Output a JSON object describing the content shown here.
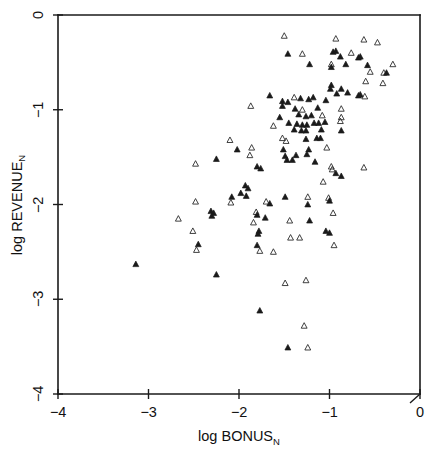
{
  "chart_data": {
    "type": "scatter",
    "title": "",
    "xlabel": "log BONUS",
    "xlabel_subscript": "N",
    "ylabel": "log REVENUE",
    "ylabel_subscript": "N",
    "xlim": [
      -4,
      0
    ],
    "ylim": [
      -4,
      0
    ],
    "xticks": [
      -4,
      -3,
      -2,
      -1,
      0
    ],
    "xtick_labels": [
      "−4",
      "−3",
      "−2",
      "−1",
      "0"
    ],
    "yticks": [
      0,
      -1,
      -2,
      -3,
      -4
    ],
    "ytick_labels": [
      "0",
      "−1",
      "−2",
      "−3",
      "−4"
    ],
    "grid": false,
    "legend": null,
    "marker": "triangle",
    "marker_colors": {
      "filled": "#1a1a1a",
      "open": "#2b2b2b"
    },
    "series": [
      {
        "name": "observations",
        "points": [
          {
            "x": -1.5,
            "y": -0.22,
            "fill": "open"
          },
          {
            "x": -0.93,
            "y": -0.25,
            "fill": "open"
          },
          {
            "x": -0.62,
            "y": -0.26,
            "fill": "open"
          },
          {
            "x": -0.47,
            "y": -0.29,
            "fill": "open"
          },
          {
            "x": -1.46,
            "y": -0.41,
            "fill": "filled"
          },
          {
            "x": -1.3,
            "y": -0.41,
            "fill": "open"
          },
          {
            "x": -0.96,
            "y": -0.39,
            "fill": "filled"
          },
          {
            "x": -0.93,
            "y": -0.38,
            "fill": "filled"
          },
          {
            "x": -0.76,
            "y": -0.4,
            "fill": "open"
          },
          {
            "x": -0.88,
            "y": -0.44,
            "fill": "filled"
          },
          {
            "x": -0.68,
            "y": -0.45,
            "fill": "filled"
          },
          {
            "x": -0.66,
            "y": -0.44,
            "fill": "filled"
          },
          {
            "x": -1.22,
            "y": -0.52,
            "fill": "filled"
          },
          {
            "x": -0.98,
            "y": -0.52,
            "fill": "open"
          },
          {
            "x": -0.98,
            "y": -0.55,
            "fill": "filled"
          },
          {
            "x": -0.82,
            "y": -0.52,
            "fill": "filled"
          },
          {
            "x": -0.58,
            "y": -0.53,
            "fill": "filled"
          },
          {
            "x": -0.3,
            "y": -0.52,
            "fill": "open"
          },
          {
            "x": -0.55,
            "y": -0.6,
            "fill": "open"
          },
          {
            "x": -0.4,
            "y": -0.61,
            "fill": "open"
          },
          {
            "x": -0.37,
            "y": -0.61,
            "fill": "filled"
          },
          {
            "x": -0.6,
            "y": -0.7,
            "fill": "open"
          },
          {
            "x": -0.41,
            "y": -0.72,
            "fill": "open"
          },
          {
            "x": -0.98,
            "y": -0.74,
            "fill": "filled"
          },
          {
            "x": -0.99,
            "y": -0.78,
            "fill": "filled"
          },
          {
            "x": -0.87,
            "y": -0.78,
            "fill": "filled"
          },
          {
            "x": -0.92,
            "y": -0.83,
            "fill": "filled"
          },
          {
            "x": -0.8,
            "y": -0.82,
            "fill": "filled"
          },
          {
            "x": -0.68,
            "y": -0.85,
            "fill": "filled"
          },
          {
            "x": -0.66,
            "y": -0.84,
            "fill": "filled"
          },
          {
            "x": -0.61,
            "y": -0.86,
            "fill": "open"
          },
          {
            "x": -1.66,
            "y": -0.85,
            "fill": "filled"
          },
          {
            "x": -1.52,
            "y": -0.91,
            "fill": "filled"
          },
          {
            "x": -1.46,
            "y": -0.92,
            "fill": "filled"
          },
          {
            "x": -1.39,
            "y": -0.87,
            "fill": "open"
          },
          {
            "x": -1.32,
            "y": -0.88,
            "fill": "filled"
          },
          {
            "x": -1.23,
            "y": -0.89,
            "fill": "filled"
          },
          {
            "x": -1.18,
            "y": -0.87,
            "fill": "filled"
          },
          {
            "x": -1.04,
            "y": -0.9,
            "fill": "filled"
          },
          {
            "x": -1.87,
            "y": -0.96,
            "fill": "open"
          },
          {
            "x": -1.52,
            "y": -0.96,
            "fill": "filled"
          },
          {
            "x": -1.38,
            "y": -0.99,
            "fill": "filled"
          },
          {
            "x": -1.3,
            "y": -1.0,
            "fill": "open"
          },
          {
            "x": -1.13,
            "y": -0.98,
            "fill": "filled"
          },
          {
            "x": -0.87,
            "y": -0.99,
            "fill": "open"
          },
          {
            "x": -1.55,
            "y": -1.08,
            "fill": "filled"
          },
          {
            "x": -1.34,
            "y": -1.05,
            "fill": "filled"
          },
          {
            "x": -1.26,
            "y": -1.07,
            "fill": "filled"
          },
          {
            "x": -1.2,
            "y": -1.06,
            "fill": "filled"
          },
          {
            "x": -1.08,
            "y": -1.06,
            "fill": "open"
          },
          {
            "x": -0.87,
            "y": -1.08,
            "fill": "open"
          },
          {
            "x": -1.62,
            "y": -1.17,
            "fill": "open"
          },
          {
            "x": -1.45,
            "y": -1.14,
            "fill": "filled"
          },
          {
            "x": -1.36,
            "y": -1.15,
            "fill": "filled"
          },
          {
            "x": -1.3,
            "y": -1.16,
            "fill": "filled"
          },
          {
            "x": -1.25,
            "y": -1.16,
            "fill": "filled"
          },
          {
            "x": -1.17,
            "y": -1.14,
            "fill": "filled"
          },
          {
            "x": -1.12,
            "y": -1.14,
            "fill": "filled"
          },
          {
            "x": -1.05,
            "y": -1.13,
            "fill": "filled"
          },
          {
            "x": -0.88,
            "y": -1.12,
            "fill": "open"
          },
          {
            "x": -1.39,
            "y": -1.21,
            "fill": "filled"
          },
          {
            "x": -1.31,
            "y": -1.22,
            "fill": "filled"
          },
          {
            "x": -1.26,
            "y": -1.22,
            "fill": "filled"
          },
          {
            "x": -1.09,
            "y": -1.21,
            "fill": "filled"
          },
          {
            "x": -0.87,
            "y": -1.22,
            "fill": "filled"
          },
          {
            "x": -1.52,
            "y": -1.3,
            "fill": "open"
          },
          {
            "x": -1.48,
            "y": -1.33,
            "fill": "open"
          },
          {
            "x": -1.26,
            "y": -1.31,
            "fill": "filled"
          },
          {
            "x": -1.14,
            "y": -1.3,
            "fill": "filled"
          },
          {
            "x": -1.1,
            "y": -1.3,
            "fill": "filled"
          },
          {
            "x": -2.1,
            "y": -1.32,
            "fill": "open"
          },
          {
            "x": -1.51,
            "y": -1.42,
            "fill": "filled"
          },
          {
            "x": -1.23,
            "y": -1.42,
            "fill": "filled"
          },
          {
            "x": -1.03,
            "y": -1.4,
            "fill": "open"
          },
          {
            "x": -2.02,
            "y": -1.42,
            "fill": "filled"
          },
          {
            "x": -1.86,
            "y": -1.4,
            "fill": "open"
          },
          {
            "x": -1.49,
            "y": -1.49,
            "fill": "filled"
          },
          {
            "x": -1.37,
            "y": -1.48,
            "fill": "filled"
          },
          {
            "x": -1.25,
            "y": -1.47,
            "fill": "filled"
          },
          {
            "x": -1.88,
            "y": -1.48,
            "fill": "open"
          },
          {
            "x": -1.47,
            "y": -1.53,
            "fill": "filled"
          },
          {
            "x": -1.41,
            "y": -1.53,
            "fill": "filled"
          },
          {
            "x": -1.16,
            "y": -1.55,
            "fill": "filled"
          },
          {
            "x": -2.25,
            "y": -1.52,
            "fill": "filled"
          },
          {
            "x": -2.48,
            "y": -1.57,
            "fill": "open"
          },
          {
            "x": -1.8,
            "y": -1.6,
            "fill": "filled"
          },
          {
            "x": -1.76,
            "y": -1.62,
            "fill": "filled"
          },
          {
            "x": -0.98,
            "y": -1.6,
            "fill": "open"
          },
          {
            "x": -0.97,
            "y": -1.63,
            "fill": "open"
          },
          {
            "x": -0.62,
            "y": -1.61,
            "fill": "open"
          },
          {
            "x": -0.93,
            "y": -1.67,
            "fill": "filled"
          },
          {
            "x": -0.87,
            "y": -1.7,
            "fill": "filled"
          },
          {
            "x": -1.07,
            "y": -1.76,
            "fill": "open"
          },
          {
            "x": -1.93,
            "y": -1.8,
            "fill": "filled"
          },
          {
            "x": -1.9,
            "y": -1.83,
            "fill": "filled"
          },
          {
            "x": -1.98,
            "y": -1.88,
            "fill": "filled"
          },
          {
            "x": -1.92,
            "y": -1.91,
            "fill": "filled"
          },
          {
            "x": -2.08,
            "y": -1.92,
            "fill": "filled"
          },
          {
            "x": -1.49,
            "y": -1.92,
            "fill": "filled"
          },
          {
            "x": -1.24,
            "y": -1.92,
            "fill": "open"
          },
          {
            "x": -1.01,
            "y": -1.93,
            "fill": "open"
          },
          {
            "x": -1.0,
            "y": -1.96,
            "fill": "filled"
          },
          {
            "x": -2.48,
            "y": -1.97,
            "fill": "open"
          },
          {
            "x": -2.09,
            "y": -1.98,
            "fill": "open"
          },
          {
            "x": -1.7,
            "y": -1.97,
            "fill": "open"
          },
          {
            "x": -1.66,
            "y": -1.99,
            "fill": "filled"
          },
          {
            "x": -1.24,
            "y": -2.0,
            "fill": "filled"
          },
          {
            "x": -0.96,
            "y": -2.09,
            "fill": "open"
          },
          {
            "x": -2.31,
            "y": -2.07,
            "fill": "filled"
          },
          {
            "x": -2.28,
            "y": -2.09,
            "fill": "filled"
          },
          {
            "x": -2.3,
            "y": -2.12,
            "fill": "filled"
          },
          {
            "x": -1.81,
            "y": -2.08,
            "fill": "open"
          },
          {
            "x": -1.8,
            "y": -2.11,
            "fill": "filled"
          },
          {
            "x": -1.71,
            "y": -2.14,
            "fill": "filled"
          },
          {
            "x": -2.67,
            "y": -2.15,
            "fill": "open"
          },
          {
            "x": -1.84,
            "y": -2.19,
            "fill": "open"
          },
          {
            "x": -1.44,
            "y": -2.17,
            "fill": "open"
          },
          {
            "x": -1.22,
            "y": -2.17,
            "fill": "filled"
          },
          {
            "x": -2.51,
            "y": -2.28,
            "fill": "open"
          },
          {
            "x": -1.78,
            "y": -2.28,
            "fill": "filled"
          },
          {
            "x": -1.79,
            "y": -2.31,
            "fill": "filled"
          },
          {
            "x": -1.04,
            "y": -2.28,
            "fill": "filled"
          },
          {
            "x": -1.0,
            "y": -2.3,
            "fill": "filled"
          },
          {
            "x": -1.43,
            "y": -2.35,
            "fill": "open"
          },
          {
            "x": -1.33,
            "y": -2.35,
            "fill": "open"
          },
          {
            "x": -2.45,
            "y": -2.42,
            "fill": "filled"
          },
          {
            "x": -1.8,
            "y": -2.43,
            "fill": "filled"
          },
          {
            "x": -0.95,
            "y": -2.43,
            "fill": "open"
          },
          {
            "x": -2.47,
            "y": -2.48,
            "fill": "open"
          },
          {
            "x": -1.77,
            "y": -2.49,
            "fill": "open"
          },
          {
            "x": -1.62,
            "y": -2.5,
            "fill": "open"
          },
          {
            "x": -3.14,
            "y": -2.63,
            "fill": "filled"
          },
          {
            "x": -2.25,
            "y": -2.74,
            "fill": "filled"
          },
          {
            "x": -1.49,
            "y": -2.83,
            "fill": "open"
          },
          {
            "x": -1.26,
            "y": -2.8,
            "fill": "open"
          },
          {
            "x": -1.77,
            "y": -3.12,
            "fill": "filled"
          },
          {
            "x": -1.28,
            "y": -3.28,
            "fill": "open"
          },
          {
            "x": -1.46,
            "y": -3.51,
            "fill": "filled"
          },
          {
            "x": -1.24,
            "y": -3.51,
            "fill": "open"
          }
        ]
      }
    ]
  },
  "figure": {
    "x_axis_title": "log BONUS",
    "x_axis_subscript": "N",
    "y_axis_title": "log REVENUE",
    "y_axis_subscript": "N"
  }
}
